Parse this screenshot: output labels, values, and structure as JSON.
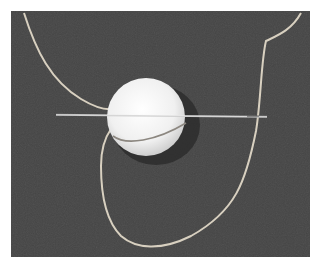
{
  "image": {
    "description": "Photograph of a white ball pierced horizontally by a needle, with a light thread looping around it on a dark gray fabric background",
    "colors": {
      "frame": "#ffffff",
      "background": "#454545",
      "ball": "#f2f2f2",
      "thread": "#d8d0c0",
      "needle": "#c8c8c8"
    }
  }
}
